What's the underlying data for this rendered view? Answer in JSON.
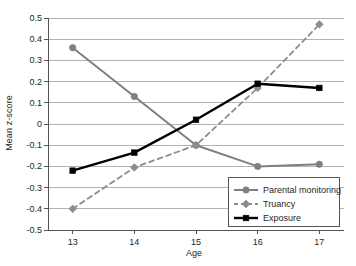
{
  "chart_data": {
    "type": "line",
    "title": "",
    "xlabel": "Age",
    "ylabel": "Mean z-score",
    "categories": [
      "13",
      "14",
      "15",
      "16",
      "17"
    ],
    "x": [
      13,
      14,
      15,
      16,
      17
    ],
    "xlim": [
      12.6,
      17.4
    ],
    "ylim": [
      -0.5,
      0.5
    ],
    "yticks": [
      "0.5",
      "0.4",
      "0.3",
      "0.2",
      "0.1",
      "0",
      "-0.1",
      "-0.2",
      "-0.3",
      "-0.4",
      "-0.5"
    ],
    "ytick_values": [
      0.5,
      0.4,
      0.3,
      0.2,
      0.1,
      0,
      -0.1,
      -0.2,
      -0.3,
      -0.4,
      -0.5
    ],
    "xticks": [
      "13",
      "14",
      "15",
      "16",
      "17"
    ],
    "grid": "horizontal",
    "legend_position": "bottom-right",
    "series": [
      {
        "name": "Parental monitoring",
        "values": [
          0.36,
          0.13,
          -0.1,
          -0.2,
          -0.19
        ],
        "color": "#7f7f7f",
        "dash": "solid",
        "marker": "circle"
      },
      {
        "name": "Truancy",
        "values": [
          -0.4,
          -0.205,
          -0.1,
          0.17,
          0.47
        ],
        "color": "#8c8c8c",
        "dash": "dashed",
        "marker": "diamond"
      },
      {
        "name": "Exposure",
        "values": [
          -0.22,
          -0.135,
          0.02,
          0.19,
          0.17
        ],
        "color": "#000000",
        "dash": "solid",
        "marker": "square"
      }
    ]
  },
  "axes": {
    "y_label": "Mean z-score",
    "x_label": "Age"
  },
  "legend": {
    "items": [
      {
        "label": "Parental monitoring"
      },
      {
        "label": "Truancy"
      },
      {
        "label": "Exposure"
      }
    ]
  },
  "colors": {
    "grid": "#b3b3b3",
    "axis": "#555555",
    "series_gray": "#7f7f7f",
    "series_black": "#000000",
    "background": "#ffffff"
  }
}
